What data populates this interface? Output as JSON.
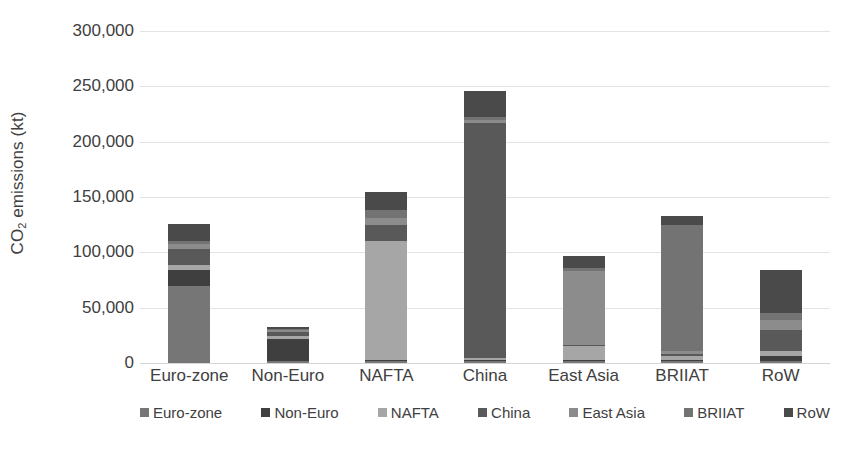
{
  "chart_data": {
    "type": "bar",
    "subtype": "stacked-bar",
    "title": "",
    "xlabel": "",
    "ylabel": "CO2 emissions (kt)",
    "ylabel_parts": {
      "prefix": "CO",
      "sub": "2",
      "suffix": " emissions (kt)"
    },
    "ylim": [
      0,
      300000
    ],
    "ytick_step": 50000,
    "ytick_labels": [
      "300,000",
      "250,000",
      "200,000",
      "150,000",
      "100,000",
      "50,000",
      "0"
    ],
    "ytick_values": [
      300000,
      250000,
      200000,
      150000,
      100000,
      50000,
      0
    ],
    "grid": true,
    "grid_axis": "y",
    "legend_position": "bottom",
    "categories": [
      "Euro-zone",
      "Non-Euro",
      "NAFTA",
      "China",
      "East Asia",
      "BRIIAT",
      "RoW"
    ],
    "series": [
      {
        "name": "Euro-zone",
        "color": "#767676",
        "values": [
          70000,
          2000,
          1500,
          2000,
          1500,
          1500,
          2000
        ]
      },
      {
        "name": "Non-Euro",
        "color": "#3f3f3f",
        "values": [
          14000,
          19500,
          1000,
          1000,
          1000,
          1500,
          4000
        ]
      },
      {
        "name": "NAFTA",
        "color": "#a6a6a6",
        "values": [
          5000,
          2500,
          108000,
          1500,
          13000,
          3000,
          5000
        ]
      },
      {
        "name": "China",
        "color": "#595959",
        "values": [
          14000,
          4000,
          14000,
          212000,
          1000,
          2000,
          19000
        ]
      },
      {
        "name": "East Asia",
        "color": "#8c8c8c",
        "values": [
          5000,
          2000,
          6500,
          3000,
          67000,
          3000,
          9000
        ]
      },
      {
        "name": "BRIIAT",
        "color": "#737373",
        "values": [
          2000,
          1000,
          7000,
          2500,
          2500,
          114000,
          6000
        ]
      },
      {
        "name": "RoW",
        "color": "#4a4a4a",
        "values": [
          16000,
          2000,
          17000,
          24000,
          11000,
          8000,
          39000
        ]
      }
    ],
    "totals": [
      126000,
      33000,
      155000,
      246000,
      97000,
      133000,
      84000
    ]
  }
}
